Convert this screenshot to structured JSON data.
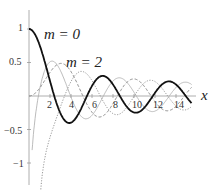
{
  "chart_data": {
    "type": "line",
    "title": "",
    "xlabel": "x",
    "ylabel": "",
    "xlim": [
      0,
      15.5
    ],
    "ylim": [
      -1.3,
      1.05
    ],
    "x_ticks": [
      "2",
      "4",
      "6",
      "8",
      "10",
      "12",
      "14"
    ],
    "y_ticks": [
      "1",
      "0.5",
      "-0.5",
      "-1"
    ],
    "grid": false,
    "annotations": [
      "m = 0",
      "m = 2"
    ],
    "series": [
      {
        "name": "J0 (m = 0)",
        "style": "solid",
        "color": "#111111",
        "function": "BesselJ(0,x)"
      },
      {
        "name": "J2 (m = 2)",
        "style": "dashed",
        "color": "#888888",
        "function": "BesselJ(2,x)"
      },
      {
        "name": "Y (dotted)",
        "style": "dotted",
        "color": "#888888",
        "function": "BesselY(2,x)-like"
      },
      {
        "name": "Y0 (thin)",
        "style": "solid-thin",
        "color": "#aaaaaa",
        "function": "BesselY(0,x)-like"
      }
    ]
  },
  "labels": {
    "x_axis": "x",
    "m0": "m = 0",
    "m2": "m = 2",
    "t1": "1",
    "t05": "0.5",
    "tm05": "−0.5",
    "tm1": "−1",
    "x2": "2",
    "x4": "4",
    "x6": "6",
    "x8": "8",
    "x10": "10",
    "x12": "12",
    "x14": "14"
  }
}
